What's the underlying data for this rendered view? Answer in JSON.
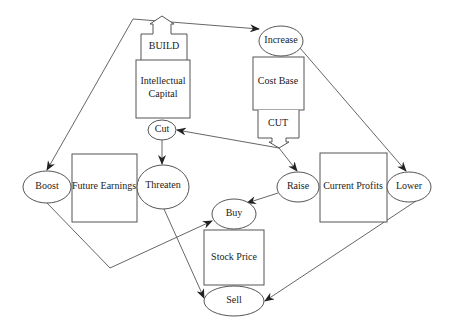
{
  "diagram": {
    "type": "causal-flow",
    "boxes": [
      {
        "id": "build",
        "label": "BUILD"
      },
      {
        "id": "intellectual_capital",
        "label_lines": [
          "Intellectual",
          "Capital"
        ]
      },
      {
        "id": "cost_base",
        "label": "Cost Base"
      },
      {
        "id": "cut_box",
        "label": "CUT"
      },
      {
        "id": "future_earnings",
        "label": "Future Earnings"
      },
      {
        "id": "current_profits",
        "label": "Current Profits"
      },
      {
        "id": "stock_price",
        "label": "Stock Price"
      }
    ],
    "ellipses": [
      {
        "id": "increase",
        "label": "Increase"
      },
      {
        "id": "cut",
        "label": "Cut"
      },
      {
        "id": "boost",
        "label": "Boost"
      },
      {
        "id": "threaten",
        "label": "Threaten"
      },
      {
        "id": "raise",
        "label": "Raise"
      },
      {
        "id": "lower",
        "label": "Lower"
      },
      {
        "id": "buy",
        "label": "Buy"
      },
      {
        "id": "sell",
        "label": "Sell"
      }
    ],
    "edges": [
      {
        "from": "build",
        "to": "boost"
      },
      {
        "from": "build",
        "to": "increase"
      },
      {
        "from": "cut_box",
        "to": "cut"
      },
      {
        "from": "cut_box",
        "to": "raise"
      },
      {
        "from": "cut",
        "to": "threaten"
      },
      {
        "from": "increase",
        "to": "lower"
      },
      {
        "from": "boost",
        "to": "buy"
      },
      {
        "from": "threaten",
        "to": "sell"
      },
      {
        "from": "raise",
        "to": "buy"
      },
      {
        "from": "lower",
        "to": "sell"
      }
    ]
  }
}
